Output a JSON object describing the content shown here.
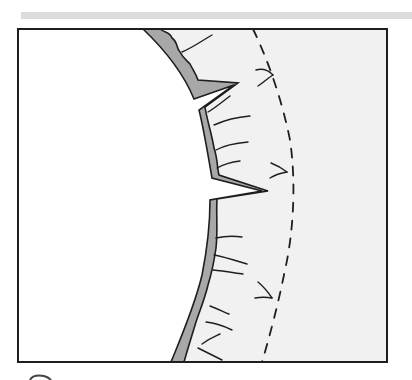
{
  "figure": {
    "colors": {
      "background": "#ffffff",
      "band": "#dcdcdc",
      "region": "#f1f1f1",
      "lining": "#a8a8a8",
      "stroke": "#1e1e1e"
    },
    "frame": {
      "x": 18,
      "y": 29,
      "width": 369,
      "height": 333
    },
    "notches": 2,
    "fiber_lines": 14,
    "crossing_marks": 3
  }
}
